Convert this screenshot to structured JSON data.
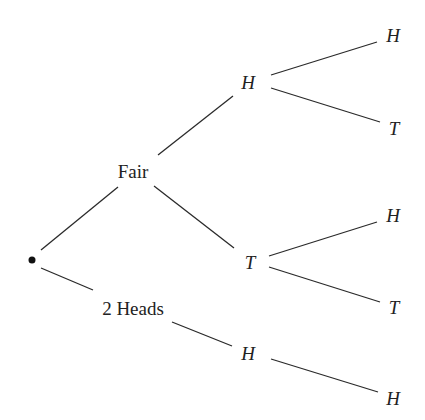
{
  "diagram": {
    "type": "probability-tree",
    "root": {
      "label": "•"
    },
    "level1": [
      {
        "id": "fair",
        "label": "Fair"
      },
      {
        "id": "two_heads",
        "label": "2 Heads"
      }
    ],
    "level2": [
      {
        "id": "fair_h",
        "parent": "fair",
        "label": "H"
      },
      {
        "id": "fair_t",
        "parent": "fair",
        "label": "T"
      },
      {
        "id": "two_h",
        "parent": "two_heads",
        "label": "H"
      }
    ],
    "level3": [
      {
        "id": "fair_h_h",
        "parent": "fair_h",
        "label": "H"
      },
      {
        "id": "fair_h_t",
        "parent": "fair_h",
        "label": "T"
      },
      {
        "id": "fair_t_h",
        "parent": "fair_t",
        "label": "H"
      },
      {
        "id": "fair_t_t",
        "parent": "fair_t",
        "label": "T"
      },
      {
        "id": "two_h_h",
        "parent": "two_h",
        "label": "H"
      }
    ],
    "colors": {
      "line": "#2a2a2a",
      "text": "#222222",
      "background": "#ffffff"
    }
  }
}
